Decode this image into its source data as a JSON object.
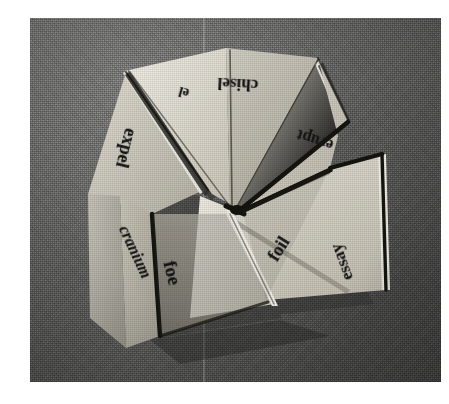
{
  "image": {
    "kind": "photograph",
    "subject": "folded paper fortune teller / cootie catcher",
    "medium": "halftone scanned print",
    "background_color": "#6c6c6b",
    "paper_color": "#d8d4c8",
    "ink_color": "#141414",
    "plate": {
      "left": 30,
      "top": 18,
      "width": 411,
      "height": 364
    },
    "canvas": {
      "width": 449,
      "height": 404
    },
    "scan_seam_x": 203
  },
  "labels": [
    {
      "id": "chisel",
      "text": "chisel",
      "x": 238,
      "y": 84,
      "rotate": 183,
      "size": 17,
      "italic": false
    },
    {
      "id": "partial",
      "text": "el",
      "x": 184,
      "y": 92,
      "rotate": 196,
      "size": 14,
      "italic": false
    },
    {
      "id": "expel",
      "text": "expel",
      "x": 126,
      "y": 148,
      "rotate": 104,
      "size": 18,
      "italic": false
    },
    {
      "id": "erupt",
      "text": "erupt",
      "x": 315,
      "y": 140,
      "rotate": 198,
      "size": 16,
      "italic": false
    },
    {
      "id": "foil",
      "text": "foil",
      "x": 279,
      "y": 249,
      "rotate": 302,
      "size": 18,
      "italic": false
    },
    {
      "id": "essay",
      "text": "essay",
      "x": 342,
      "y": 262,
      "rotate": 250,
      "size": 17,
      "italic": false
    },
    {
      "id": "foe",
      "text": "foe",
      "x": 172,
      "y": 273,
      "rotate": 76,
      "size": 19,
      "italic": false
    },
    {
      "id": "cranium",
      "text": "cranium",
      "x": 135,
      "y": 252,
      "rotate": 65,
      "size": 16,
      "italic": true
    }
  ],
  "facets": [
    {
      "id": "upper-left-flap",
      "fill": "#cfcabc"
    },
    {
      "id": "upper-inner-left",
      "fill": "#e5e1d6"
    },
    {
      "id": "upper-inner-right",
      "fill": "#d3cfc2"
    },
    {
      "id": "upper-right-flap",
      "fill": "#c9c4b6"
    },
    {
      "id": "right-flap",
      "fill": "#cdc8ba"
    },
    {
      "id": "lower-right-flap",
      "fill": "#dcd8cc"
    },
    {
      "id": "lower-inner",
      "fill": "#9e9a90"
    },
    {
      "id": "lower-left-flap",
      "fill": "#b9b5a9"
    },
    {
      "id": "left-flap",
      "fill": "#c6c1b3"
    }
  ],
  "colors": {
    "fold_shadow": "#1b1b1b",
    "highlight": "#f2efe6",
    "cloth_dark": "#5c5c5b",
    "cloth_light": "#7d7d7c"
  }
}
